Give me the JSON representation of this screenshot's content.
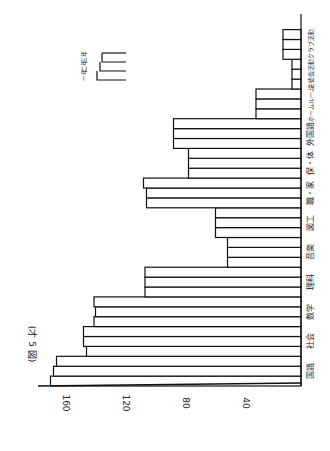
{
  "title": "(才 5 図)",
  "chart_data": {
    "type": "bar",
    "orientation": "rotated-90-ccw",
    "title": "(才 5 図)",
    "xlabel": "",
    "ylabel": "",
    "ylim": [
      0,
      170
    ],
    "yticks": [
      40,
      80,
      120,
      160
    ],
    "grid": false,
    "legend_position": "top-left (rotated)",
    "categories": [
      "国語",
      "社会",
      "数学",
      "理科",
      "音楽",
      "図工",
      "職・家",
      "保・体",
      "外国語",
      "ホームルーム",
      "生徒会活動",
      "クラブ活動"
    ],
    "series": [
      {
        "name": "一年",
        "values": [
          167,
          143,
          138,
          104,
          49,
          57,
          103,
          75,
          85,
          30,
          6,
          12
        ]
      },
      {
        "name": "二年",
        "values": [
          165,
          145,
          137,
          104,
          49,
          57,
          103,
          75,
          85,
          30,
          6,
          12
        ]
      },
      {
        "name": "三年",
        "values": [
          163,
          145,
          138,
          104,
          49,
          57,
          105,
          75,
          85,
          30,
          6,
          12
        ]
      }
    ]
  },
  "legend": {
    "items": [
      "一年",
      "二年",
      "三年"
    ]
  },
  "colors": {
    "line": "#111111",
    "background": "#ffffff"
  }
}
